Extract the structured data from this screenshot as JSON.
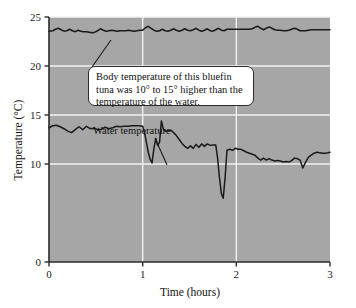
{
  "figure": {
    "background_color": "#ffffff",
    "plot_background_color": "#a6a6a6",
    "grid_color": "#f2f2f2",
    "axis_color": "#2b2b2b",
    "line_color": "#1a1a1a"
  },
  "annotations": {
    "callout": {
      "text": "Body temperature of this bluefin tuna was 10° to 15° higher than the temperature of the water.",
      "line1": "Body temperature of this bluefin",
      "line2": "tuna was 10° to 15° higher than the",
      "line3": "temperature of the water."
    },
    "water_label": "Water temperature"
  },
  "chart_data": {
    "type": "line",
    "title": "",
    "xlabel": "Time (hours)",
    "ylabel": "Temperature (°C)",
    "xlim": [
      0,
      3
    ],
    "ylim": [
      0,
      25
    ],
    "xticks": [
      0,
      1,
      2,
      3
    ],
    "yticks": [
      0,
      10,
      15,
      20,
      25
    ],
    "xtick_labels": [
      "0",
      "1",
      "2",
      "3"
    ],
    "ytick_labels": [
      "0",
      "10",
      "15",
      "20",
      "25"
    ],
    "grid": true,
    "grid_axes": "both",
    "legend_position": "none",
    "series": [
      {
        "name": "Body temperature",
        "color": "#1a1a1a",
        "x": [
          0.0,
          0.04,
          0.07,
          0.1,
          0.13,
          0.16,
          0.19,
          0.22,
          0.25,
          0.28,
          0.31,
          0.34,
          0.37,
          0.4,
          0.43,
          0.46,
          0.49,
          0.52,
          0.55,
          0.58,
          0.61,
          0.64,
          0.67,
          0.7,
          0.73,
          0.76,
          0.79,
          0.82,
          0.85,
          0.88,
          0.91,
          0.94,
          0.97,
          1.0,
          1.03,
          1.06,
          1.09,
          1.12,
          1.15,
          1.18,
          1.21,
          1.24,
          1.27,
          1.3,
          1.33,
          1.36,
          1.39,
          1.42,
          1.45,
          1.48,
          1.51,
          1.54,
          1.57,
          1.6,
          1.63,
          1.66,
          1.69,
          1.72,
          1.75,
          1.78,
          1.81,
          1.84,
          1.87,
          1.9,
          1.93,
          1.96,
          1.99,
          2.02,
          2.05,
          2.08,
          2.11,
          2.14,
          2.17,
          2.2,
          2.23,
          2.26,
          2.29,
          2.32,
          2.35,
          2.38,
          2.41,
          2.44,
          2.47,
          2.5,
          2.53,
          2.56,
          2.59,
          2.62,
          2.65,
          2.68,
          2.71,
          2.74,
          2.77,
          2.8,
          2.83,
          2.86,
          2.89,
          2.92,
          2.95,
          3.0
        ],
        "values": [
          23.55,
          23.6,
          23.75,
          23.85,
          23.7,
          23.55,
          23.6,
          23.75,
          23.6,
          23.5,
          23.65,
          23.55,
          23.5,
          23.5,
          23.45,
          23.4,
          23.45,
          23.6,
          23.8,
          23.65,
          23.55,
          23.6,
          23.65,
          23.6,
          23.55,
          23.6,
          23.6,
          23.6,
          23.65,
          23.6,
          23.55,
          23.6,
          23.65,
          23.65,
          23.9,
          24.05,
          23.85,
          23.65,
          23.55,
          23.6,
          23.75,
          23.6,
          23.55,
          23.65,
          23.8,
          23.65,
          23.55,
          23.65,
          23.8,
          23.65,
          23.6,
          23.7,
          23.85,
          23.65,
          23.55,
          23.65,
          23.8,
          23.6,
          23.55,
          23.7,
          23.85,
          23.65,
          23.6,
          23.75,
          23.75,
          23.75,
          23.75,
          23.75,
          23.75,
          23.75,
          23.75,
          23.75,
          23.8,
          23.95,
          24.05,
          23.85,
          23.7,
          23.85,
          24.0,
          23.85,
          23.7,
          23.65,
          23.65,
          23.6,
          23.6,
          23.65,
          23.75,
          23.85,
          23.75,
          23.6,
          23.6,
          23.6,
          23.65,
          23.7,
          23.7,
          23.7,
          23.7,
          23.7,
          23.7,
          23.7
        ]
      },
      {
        "name": "Water temperature",
        "color": "#1a1a1a",
        "x": [
          0.0,
          0.04,
          0.08,
          0.12,
          0.16,
          0.2,
          0.24,
          0.28,
          0.32,
          0.36,
          0.4,
          0.44,
          0.48,
          0.52,
          0.56,
          0.6,
          0.64,
          0.68,
          0.72,
          0.76,
          0.8,
          0.84,
          0.88,
          0.92,
          0.96,
          1.0,
          1.02,
          1.04,
          1.06,
          1.08,
          1.1,
          1.12,
          1.14,
          1.16,
          1.18,
          1.2,
          1.22,
          1.24,
          1.27,
          1.3,
          1.33,
          1.36,
          1.39,
          1.42,
          1.45,
          1.48,
          1.51,
          1.54,
          1.57,
          1.6,
          1.63,
          1.66,
          1.69,
          1.72,
          1.75,
          1.78,
          1.8,
          1.82,
          1.84,
          1.86,
          1.88,
          1.9,
          1.93,
          1.96,
          1.99,
          2.02,
          2.05,
          2.08,
          2.11,
          2.14,
          2.17,
          2.2,
          2.23,
          2.26,
          2.29,
          2.32,
          2.35,
          2.38,
          2.41,
          2.44,
          2.47,
          2.5,
          2.53,
          2.56,
          2.59,
          2.62,
          2.65,
          2.68,
          2.71,
          2.74,
          2.77,
          2.8,
          2.83,
          2.86,
          2.89,
          2.92,
          2.95,
          2.98,
          3.0
        ],
        "values": [
          13.7,
          13.9,
          13.95,
          13.8,
          13.6,
          13.35,
          13.2,
          13.5,
          13.8,
          13.5,
          13.85,
          13.6,
          13.65,
          13.5,
          13.55,
          13.75,
          13.6,
          13.7,
          13.85,
          13.8,
          13.85,
          13.85,
          13.9,
          13.9,
          13.9,
          13.85,
          13.2,
          12.2,
          11.2,
          10.5,
          10.1,
          11.6,
          12.6,
          11.9,
          12.2,
          14.4,
          13.6,
          13.35,
          13.4,
          13.45,
          13.2,
          12.9,
          12.5,
          12.1,
          11.8,
          11.6,
          11.85,
          11.6,
          12.0,
          11.7,
          12.05,
          11.8,
          12.05,
          11.9,
          11.95,
          11.95,
          10.6,
          8.6,
          7.0,
          6.5,
          8.6,
          11.4,
          11.5,
          11.4,
          11.6,
          11.5,
          11.5,
          11.35,
          11.2,
          11.1,
          11.0,
          10.9,
          10.6,
          10.4,
          10.6,
          10.4,
          10.55,
          10.4,
          10.3,
          10.35,
          10.3,
          10.2,
          10.25,
          10.2,
          10.35,
          10.6,
          10.55,
          10.4,
          9.6,
          10.2,
          10.7,
          10.9,
          11.1,
          11.2,
          11.15,
          11.1,
          11.1,
          11.15,
          11.2
        ]
      }
    ]
  }
}
